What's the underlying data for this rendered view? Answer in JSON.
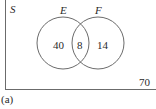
{
  "diagram": {
    "type": "venn",
    "universe_label": "S",
    "sets": [
      {
        "name": "E",
        "only": "40"
      },
      {
        "name": "F",
        "only": "14"
      }
    ],
    "intersection": "8",
    "outside": "70",
    "caption": "(a)",
    "colors": {
      "stroke": "#6b6b6b",
      "text": "#2a2a2a",
      "background": "#ffffff"
    }
  }
}
